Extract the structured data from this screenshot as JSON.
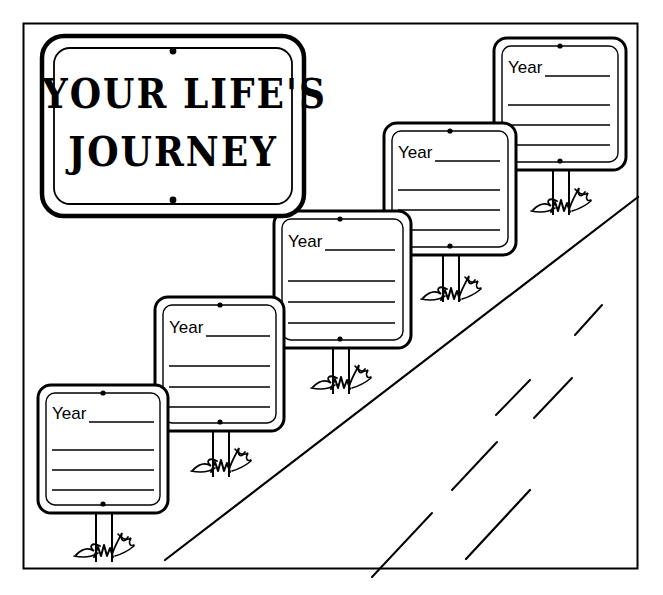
{
  "page": {
    "width": 663,
    "height": 595,
    "background_color": "#ffffff",
    "ink_color": "#000000"
  },
  "frame": {
    "name": "worksheet-border",
    "x": 23,
    "y": 23,
    "width": 615,
    "height": 546,
    "stroke_width": 2
  },
  "title_sign": {
    "name": "title-sign",
    "line1": "YOUR LIFE'S",
    "line2": "JOURNEY",
    "x": 42,
    "y": 36,
    "width": 262,
    "height": 180,
    "rivets": 2
  },
  "year_signs": [
    {
      "id": "year-sign-1",
      "label": "Year",
      "blank_line": "_________",
      "body_lines": 3,
      "x": 38,
      "y": 385,
      "width": 130,
      "height": 128,
      "post_top": 513,
      "post_bottom": 562,
      "post_center": 103
    },
    {
      "id": "year-sign-2",
      "label": "Year",
      "blank_line": "_________",
      "body_lines": 3,
      "x": 155,
      "y": 297,
      "width": 129,
      "height": 134,
      "post_top": 431,
      "post_bottom": 477,
      "post_center": 220
    },
    {
      "id": "year-sign-3",
      "label": "Year",
      "blank_line": "_________",
      "body_lines": 3,
      "x": 274,
      "y": 211,
      "width": 137,
      "height": 137,
      "post_top": 348,
      "post_bottom": 394,
      "post_center": 340
    },
    {
      "id": "year-sign-4",
      "label": "Year",
      "blank_line": "_________",
      "body_lines": 3,
      "x": 384,
      "y": 123,
      "width": 132,
      "height": 132,
      "post_top": 255,
      "post_bottom": 302,
      "post_center": 450
    },
    {
      "id": "year-sign-5",
      "label": "Year",
      "blank_line": "_________",
      "body_lines": 3,
      "x": 494,
      "y": 38,
      "width": 132,
      "height": 132,
      "post_top": 170,
      "post_bottom": 215,
      "post_center": 560
    }
  ],
  "road": {
    "name": "road",
    "edge_line": {
      "x1": 165,
      "y1": 560,
      "x2": 638,
      "y2": 197
    },
    "center_dashes": [
      {
        "x1": 496,
        "y1": 415,
        "x2": 530,
        "y2": 380
      },
      {
        "x1": 452,
        "y1": 490,
        "x2": 497,
        "y2": 442
      },
      {
        "x1": 372,
        "y1": 577,
        "x2": 432,
        "y2": 513
      },
      {
        "x1": 575,
        "y1": 335,
        "x2": 602,
        "y2": 305
      },
      {
        "x1": 534,
        "y1": 418,
        "x2": 572,
        "y2": 378
      },
      {
        "x1": 466,
        "y1": 559,
        "x2": 530,
        "y2": 490
      }
    ]
  },
  "grass_tufts": [
    {
      "id": "grass-1",
      "cx": 103,
      "cy": 545
    },
    {
      "id": "grass-2",
      "cx": 220,
      "cy": 460
    },
    {
      "id": "grass-3",
      "cx": 340,
      "cy": 377
    },
    {
      "id": "grass-4",
      "cx": 450,
      "cy": 288
    },
    {
      "id": "grass-5",
      "cx": 560,
      "cy": 200
    }
  ]
}
